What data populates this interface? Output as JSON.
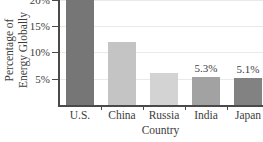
{
  "chart_data": {
    "type": "bar",
    "categories": [
      "U.S.",
      "China",
      "Russia",
      "India",
      "Japan"
    ],
    "values": [
      null,
      12,
      6,
      5.3,
      5.1
    ],
    "bar_labels": [
      "",
      "",
      "",
      "5.3%",
      "5.1%"
    ],
    "bar_colors": [
      "#767676",
      "#c4c4c4",
      "#d3d3d3",
      "#a2a2a2",
      "#828282"
    ],
    "title": "",
    "xlabel": "Country",
    "ylabel": "Percentage of Energy Globally",
    "ylabel_lines": [
      "Percentage of",
      "Energy Globally"
    ],
    "ytick_labels": [
      "5%",
      "10%",
      "15%",
      "20%"
    ],
    "ytick_values": [
      5,
      10,
      15,
      20
    ],
    "ylim": [
      0,
      20
    ],
    "grid": "horizontal, light gray",
    "legend": "none",
    "notes": {
      "clipped_top": "U.S. bar and 20% tick label are cut off at the top edge of the image",
      "value_labels_shown_for": [
        "India",
        "Japan"
      ]
    },
    "colors": {
      "axis": "#4a4a4a",
      "gridline": "#e9e9e9",
      "text": "#3d3d3d",
      "background": "#ffffff"
    }
  }
}
